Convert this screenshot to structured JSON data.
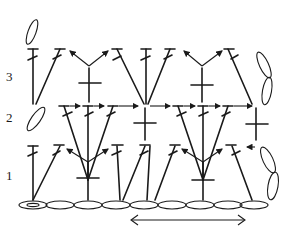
{
  "diagram": {
    "type": "crochet-stitch-chart",
    "row_labels": [
      {
        "label": "3",
        "x": 6,
        "y": 70
      },
      {
        "label": "2",
        "x": 6,
        "y": 111
      },
      {
        "label": "1",
        "x": 6,
        "y": 169
      }
    ],
    "foundation_chain": {
      "count": 9,
      "x_start": 20,
      "x_end": 268,
      "y": 205
    },
    "repeat_arrow": {
      "x_start": 130,
      "x_end": 246,
      "y": 220,
      "direction": "both"
    },
    "colors": {
      "ink": "#1a1a1a",
      "background": "#ffffff"
    },
    "symbols": [
      "chain",
      "double-crochet",
      "treble-crochet",
      "single-crochet",
      "turning-chain"
    ]
  }
}
